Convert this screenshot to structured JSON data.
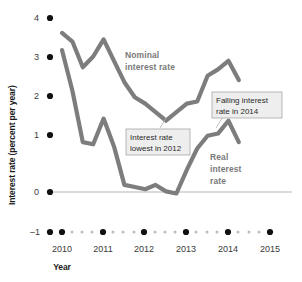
{
  "chart_data": {
    "type": "line",
    "title": "",
    "xlabel": "Year",
    "ylabel": "Interest rate (percent per year)",
    "xlim": [
      2010,
      2015
    ],
    "ylim": [
      -1,
      4
    ],
    "yticks": [
      4,
      3,
      2,
      1,
      0,
      -1
    ],
    "ytick_labels": [
      "4",
      "3",
      "2",
      "1",
      "0",
      "–1"
    ],
    "xticks": [
      2010,
      2011,
      2012,
      2013,
      2014,
      2015
    ],
    "xtick_labels": [
      "2010",
      "2011",
      "2012",
      "2013",
      "2014",
      "2015"
    ],
    "grid": false,
    "legend": "inline-labels",
    "zero_line": true,
    "series": [
      {
        "name": "Nominal interest rate",
        "color": "#7d7d7d",
        "x": [
          2010.0,
          2010.25,
          2010.5,
          2010.75,
          2011.0,
          2011.25,
          2011.5,
          2011.75,
          2012.0,
          2012.25,
          2012.5,
          2012.75,
          2013.0,
          2013.25,
          2013.5,
          2013.75,
          2014.0,
          2014.25
        ],
        "values": [
          3.65,
          3.45,
          2.85,
          3.1,
          3.5,
          3.0,
          2.5,
          2.15,
          2.0,
          1.8,
          1.6,
          1.8,
          2.0,
          2.05,
          2.65,
          2.8,
          3.0,
          2.55
        ]
      },
      {
        "name": "Real interest rate",
        "color": "#7d7d7d",
        "x": [
          2010.0,
          2010.25,
          2010.5,
          2010.75,
          2011.0,
          2011.25,
          2011.5,
          2011.75,
          2012.0,
          2012.25,
          2012.5,
          2012.75,
          2013.0,
          2013.25,
          2013.5,
          2013.75,
          2014.0,
          2014.25
        ],
        "values": [
          3.25,
          2.3,
          1.1,
          1.05,
          1.65,
          1.0,
          0.1,
          0.05,
          0.0,
          0.1,
          -0.05,
          -0.1,
          0.45,
          0.95,
          1.25,
          1.3,
          1.6,
          1.1
        ]
      }
    ],
    "annotations": [
      {
        "id": "lowest-2012",
        "text_line1": "Interest rate",
        "text_line2": "lowest in 2012",
        "points_to": "nominal minimum 2012"
      },
      {
        "id": "falling-2014",
        "text_line1": "Falling interest",
        "text_line2": "rate in 2014",
        "points_to": "nominal peak 2014"
      }
    ],
    "series_labels": [
      {
        "id": "nominal",
        "line1": "Nominal",
        "line2": "interest rate"
      },
      {
        "id": "real",
        "line1": "Real",
        "line2": "interest",
        "line3": "rate"
      }
    ]
  }
}
